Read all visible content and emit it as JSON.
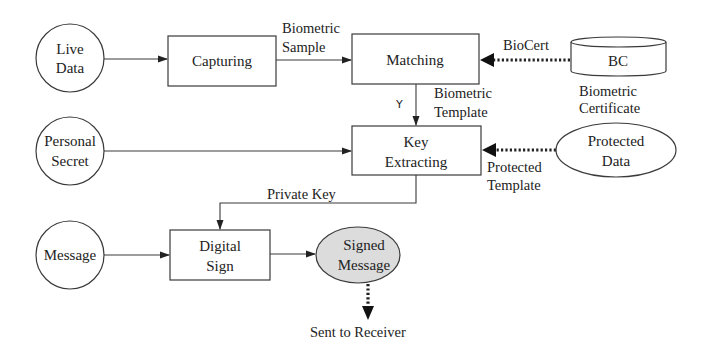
{
  "diagram": {
    "type": "flowchart",
    "nodes": {
      "live_data": {
        "shape": "circle",
        "line1": "Live",
        "line2": "Data"
      },
      "capturing": {
        "shape": "rect",
        "label": "Capturing"
      },
      "matching": {
        "shape": "rect",
        "label": "Matching"
      },
      "bc": {
        "shape": "cylinder",
        "label": "BC",
        "caption_line1": "Biometric",
        "caption_line2": "Certificate"
      },
      "personal_secret": {
        "shape": "circle",
        "line1": "Personal",
        "line2": "Secret"
      },
      "key_extracting": {
        "shape": "rect",
        "line1": "Key",
        "line2": "Extracting"
      },
      "protected_data": {
        "shape": "ellipse",
        "line1": "Protected",
        "line2": "Data"
      },
      "message": {
        "shape": "circle",
        "label": "Message"
      },
      "digital_sign": {
        "shape": "rect",
        "line1": "Digital",
        "line2": "Sign"
      },
      "signed_message": {
        "shape": "ellipse",
        "fill": "#dcdcdc",
        "line1": "Signed",
        "line2": "Message"
      },
      "sent_to_receiver": {
        "shape": "text",
        "label": "Sent to Receiver"
      }
    },
    "edges": {
      "biometric_sample": {
        "from": "capturing",
        "to": "matching",
        "style": "solid",
        "line1": "Biometric",
        "line2": "Sample"
      },
      "biocert": {
        "from": "bc",
        "to": "matching",
        "style": "dotted-bold",
        "label": "BioCert"
      },
      "biometric_template": {
        "from": "matching",
        "to": "key_extracting",
        "style": "solid",
        "condition": "Y",
        "line1": "Biometric",
        "line2": "Template"
      },
      "protected_template": {
        "from": "protected_data",
        "to": "key_extracting",
        "style": "dotted-bold",
        "line1": "Protected",
        "line2": "Template"
      },
      "private_key": {
        "from": "key_extracting",
        "to": "digital_sign",
        "style": "solid",
        "label": "Private Key"
      },
      "live_to_capturing": {
        "from": "live_data",
        "to": "capturing",
        "style": "solid"
      },
      "secret_to_key": {
        "from": "personal_secret",
        "to": "key_extracting",
        "style": "solid"
      },
      "message_to_sign": {
        "from": "message",
        "to": "digital_sign",
        "style": "solid"
      },
      "sign_to_signed": {
        "from": "digital_sign",
        "to": "signed_message",
        "style": "solid"
      },
      "signed_to_receiver": {
        "from": "signed_message",
        "to": "sent_to_receiver",
        "style": "dotted-bold"
      }
    },
    "colors": {
      "stroke": "#3a3a3a",
      "text": "#222222",
      "signed_fill": "#dcdcdc",
      "background": "#ffffff"
    }
  }
}
